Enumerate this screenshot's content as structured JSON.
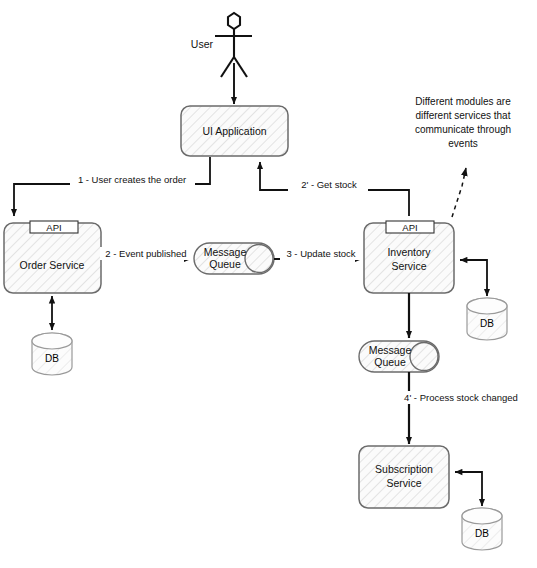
{
  "diagram": {
    "style": {
      "stroke": "#4d4d4d",
      "arrow_stroke": "#111111",
      "hatch_color": "#c9c9c9",
      "fill": "#fbfbfb",
      "text_color": "#111111",
      "background": "#ffffff"
    },
    "actor": {
      "name": "User",
      "label": "User"
    },
    "nodes": [
      {
        "id": "ui",
        "label_line1": "UI Application",
        "label_line2": "",
        "type": "box",
        "api": ""
      },
      {
        "id": "order",
        "label_line1": "Order Service",
        "label_line2": "",
        "type": "box-with-api",
        "api": "API"
      },
      {
        "id": "inventory",
        "label_line1": "Inventory",
        "label_line2": "Service",
        "type": "box-with-api",
        "api": "API"
      },
      {
        "id": "subscription",
        "label_line1": "Subscription",
        "label_line2": "Service",
        "type": "box",
        "api": ""
      },
      {
        "id": "mq1",
        "label_line1": "Message",
        "label_line2": "Queue",
        "type": "queue",
        "api": ""
      },
      {
        "id": "mq2",
        "label_line1": "Message",
        "label_line2": "Queue",
        "type": "queue",
        "api": ""
      },
      {
        "id": "db_order",
        "label_line1": "DB",
        "label_line2": "",
        "type": "cylinder",
        "api": ""
      },
      {
        "id": "db_inventory",
        "label_line1": "DB",
        "label_line2": "",
        "type": "cylinder",
        "api": ""
      },
      {
        "id": "db_subscription",
        "label_line1": "DB",
        "label_line2": "",
        "type": "cylinder",
        "api": ""
      }
    ],
    "edges": [
      {
        "id": "e_user_ui",
        "label": "",
        "from": "User",
        "to": "UI Application"
      },
      {
        "id": "e_ui_order",
        "label": "1 - User creates the order",
        "from": "UI Application",
        "to": "Order Service"
      },
      {
        "id": "e_order_mq1",
        "label": "2 - Event published",
        "from": "Order Service",
        "to": "Message Queue"
      },
      {
        "id": "e_mq1_inventory",
        "label": "3 - Update stock",
        "from": "Message Queue",
        "to": "Inventory Service"
      },
      {
        "id": "e_inventory_ui",
        "label": "2' - Get stock",
        "from": "Inventory Service",
        "to": "UI Application"
      },
      {
        "id": "e_mq2_sub",
        "label": "4' - Process stock changed",
        "from": "Message Queue",
        "to": "Subscription Service"
      },
      {
        "id": "e_inventory_mq2",
        "label": "",
        "from": "Inventory Service",
        "to": "Message Queue"
      },
      {
        "id": "e_order_db",
        "label": "",
        "from": "Order Service",
        "to": "DB"
      },
      {
        "id": "e_inventory_db",
        "label": "",
        "from": "Inventory Service",
        "to": "DB"
      },
      {
        "id": "e_sub_db",
        "label": "",
        "from": "Subscription Service",
        "to": "DB"
      }
    ],
    "note": {
      "lines": [
        "Different modules are",
        "different services that",
        "communicate through",
        "events"
      ]
    },
    "labels": {
      "api": "API",
      "db": "DB",
      "queue_line1": "Message",
      "queue_line2": "Queue",
      "ui_app": "UI Application",
      "order_service": "Order Service",
      "inventory_line1": "Inventory",
      "inventory_line2": "Service",
      "subscription_line1": "Subscription",
      "subscription_line2": "Service",
      "user": "User",
      "edge1": "1 - User creates the order",
      "edge2": "2 - Event published",
      "edge3": "3 - Update stock",
      "edge2p": "2' - Get stock",
      "edge4p": "4' - Process stock changed",
      "note1": "Different modules are",
      "note2": "different services that",
      "note3": "communicate through",
      "note4": "events"
    }
  }
}
